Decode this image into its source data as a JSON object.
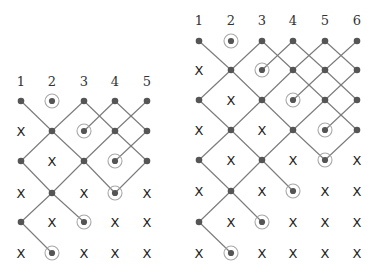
{
  "colors": {
    "edge": "#7a7a7a",
    "dot": "#555555",
    "ring": "#a8a8a8",
    "label": "#333333",
    "x_mark": "#222222"
  },
  "diagrams": [
    {
      "name": "left-diagram",
      "columns": [
        "1",
        "2",
        "3",
        "4",
        "5"
      ],
      "col_x": [
        21,
        52,
        84,
        115,
        147
      ],
      "label_y": 86,
      "row_y": [
        101,
        131,
        161,
        193,
        222,
        253
      ],
      "grid": [
        [
          "dot",
          "circled",
          "dot",
          "dot",
          "dot"
        ],
        [
          "x",
          "dot",
          "circled",
          "dot",
          "dot"
        ],
        [
          "dot",
          "x",
          "dot",
          "circled",
          "dot"
        ],
        [
          "x",
          "dot",
          "x",
          "circled",
          "x"
        ],
        [
          "dot",
          "x",
          "circled",
          "x",
          "x"
        ],
        [
          "x",
          "circled",
          "x",
          "x",
          "x"
        ]
      ],
      "edges": [
        [
          [
            0,
            0
          ],
          [
            1,
            1
          ]
        ],
        [
          [
            1,
            1
          ],
          [
            2,
            0
          ]
        ],
        [
          [
            2,
            0
          ],
          [
            3,
            1
          ]
        ],
        [
          [
            2,
            1
          ],
          [
            3,
            0
          ]
        ],
        [
          [
            3,
            0
          ],
          [
            4,
            1
          ]
        ],
        [
          [
            3,
            1
          ],
          [
            4,
            0
          ]
        ],
        [
          [
            1,
            1
          ],
          [
            0,
            2
          ]
        ],
        [
          [
            1,
            1
          ],
          [
            2,
            2
          ]
        ],
        [
          [
            3,
            1
          ],
          [
            2,
            2
          ]
        ],
        [
          [
            3,
            1
          ],
          [
            4,
            2
          ]
        ],
        [
          [
            4,
            1
          ],
          [
            3,
            2
          ]
        ],
        [
          [
            0,
            2
          ],
          [
            1,
            3
          ]
        ],
        [
          [
            2,
            2
          ],
          [
            1,
            3
          ]
        ],
        [
          [
            2,
            2
          ],
          [
            3,
            3
          ]
        ],
        [
          [
            4,
            2
          ],
          [
            3,
            3
          ]
        ],
        [
          [
            1,
            3
          ],
          [
            0,
            4
          ]
        ],
        [
          [
            1,
            3
          ],
          [
            2,
            4
          ]
        ],
        [
          [
            0,
            4
          ],
          [
            1,
            5
          ]
        ]
      ]
    },
    {
      "name": "right-diagram",
      "columns": [
        "1",
        "2",
        "3",
        "4",
        "5",
        "6"
      ],
      "col_x": [
        199,
        231,
        262,
        293,
        325,
        357
      ],
      "label_y": 25,
      "row_y": [
        41,
        70,
        100,
        130,
        160,
        191,
        222,
        253
      ],
      "grid": [
        [
          "dot",
          "circled",
          "dot",
          "dot",
          "dot",
          "dot"
        ],
        [
          "x",
          "dot",
          "circled",
          "dot",
          "dot",
          "dot"
        ],
        [
          "dot",
          "x",
          "dot",
          "circled",
          "dot",
          "dot"
        ],
        [
          "x",
          "dot",
          "x",
          "dot",
          "circled",
          "dot"
        ],
        [
          "dot",
          "x",
          "dot",
          "x",
          "circled",
          "x"
        ],
        [
          "x",
          "dot",
          "x",
          "circled",
          "x",
          "x"
        ],
        [
          "dot",
          "x",
          "circled",
          "x",
          "x",
          "x"
        ],
        [
          "x",
          "circled",
          "x",
          "x",
          "x",
          "x"
        ]
      ],
      "edges": [
        [
          [
            0,
            0
          ],
          [
            1,
            1
          ]
        ],
        [
          [
            1,
            1
          ],
          [
            2,
            0
          ]
        ],
        [
          [
            2,
            0
          ],
          [
            3,
            1
          ]
        ],
        [
          [
            2,
            1
          ],
          [
            3,
            0
          ]
        ],
        [
          [
            3,
            0
          ],
          [
            4,
            1
          ]
        ],
        [
          [
            3,
            1
          ],
          [
            4,
            0
          ]
        ],
        [
          [
            4,
            0
          ],
          [
            5,
            1
          ]
        ],
        [
          [
            4,
            1
          ],
          [
            5,
            0
          ]
        ],
        [
          [
            1,
            1
          ],
          [
            0,
            2
          ]
        ],
        [
          [
            1,
            1
          ],
          [
            2,
            2
          ]
        ],
        [
          [
            3,
            1
          ],
          [
            2,
            2
          ]
        ],
        [
          [
            3,
            1
          ],
          [
            4,
            2
          ]
        ],
        [
          [
            4,
            1
          ],
          [
            3,
            2
          ]
        ],
        [
          [
            4,
            1
          ],
          [
            5,
            2
          ]
        ],
        [
          [
            5,
            1
          ],
          [
            4,
            2
          ]
        ],
        [
          [
            0,
            2
          ],
          [
            1,
            3
          ]
        ],
        [
          [
            2,
            2
          ],
          [
            1,
            3
          ]
        ],
        [
          [
            2,
            2
          ],
          [
            3,
            3
          ]
        ],
        [
          [
            4,
            2
          ],
          [
            3,
            3
          ]
        ],
        [
          [
            4,
            2
          ],
          [
            5,
            3
          ]
        ],
        [
          [
            5,
            2
          ],
          [
            4,
            3
          ]
        ],
        [
          [
            1,
            3
          ],
          [
            0,
            4
          ]
        ],
        [
          [
            1,
            3
          ],
          [
            2,
            4
          ]
        ],
        [
          [
            3,
            3
          ],
          [
            2,
            4
          ]
        ],
        [
          [
            3,
            3
          ],
          [
            4,
            4
          ]
        ],
        [
          [
            5,
            3
          ],
          [
            4,
            4
          ]
        ],
        [
          [
            0,
            4
          ],
          [
            1,
            5
          ]
        ],
        [
          [
            2,
            4
          ],
          [
            1,
            5
          ]
        ],
        [
          [
            2,
            4
          ],
          [
            3,
            5
          ]
        ],
        [
          [
            1,
            5
          ],
          [
            0,
            6
          ]
        ],
        [
          [
            1,
            5
          ],
          [
            2,
            6
          ]
        ],
        [
          [
            0,
            6
          ],
          [
            1,
            7
          ]
        ]
      ]
    }
  ]
}
